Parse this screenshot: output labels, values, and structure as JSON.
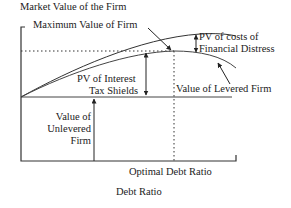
{
  "diagram": {
    "y_axis_label": "Market Value of the Firm",
    "x_axis_label": "Debt Ratio",
    "labels": {
      "max_value": "Maximum Value of Firm",
      "pv_distress_line1": "PV of costs of",
      "pv_distress_line2": "Financial Distress",
      "pv_tax_line1": "PV of Interest",
      "pv_tax_line2": "Tax Shields",
      "levered": "Value of Levered Firm",
      "unlevered_line1": "Value of",
      "unlevered_line2": "Unlevered",
      "unlevered_line3": "Firm",
      "optimal": "Optimal Debt Ratio"
    },
    "colors": {
      "line": "#333333",
      "background": "#ffffff"
    }
  }
}
